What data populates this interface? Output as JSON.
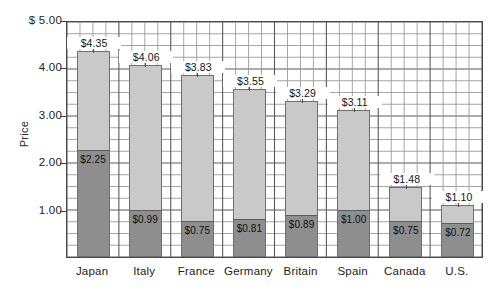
{
  "chart_data": {
    "type": "bar",
    "subtype": "stacked-bar",
    "title": "",
    "xlabel": "",
    "ylabel": "Price",
    "ylim": [
      0,
      5
    ],
    "y_ticks": [
      {
        "value": 5,
        "label": "$ 5.00"
      },
      {
        "value": 4,
        "label": "4.00"
      },
      {
        "value": 3,
        "label": "3.00"
      },
      {
        "value": 2,
        "label": "2.00"
      },
      {
        "value": 1,
        "label": "1.00"
      }
    ],
    "y_minor_step": 0.25,
    "grid": true,
    "legend": "none",
    "categories": [
      "Japan",
      "Italy",
      "France",
      "Germany",
      "Britain",
      "Spain",
      "Canada",
      "U.S."
    ],
    "series": [
      {
        "name": "Base price",
        "color": "#8e8e8e",
        "values": [
          2.25,
          0.99,
          0.75,
          0.81,
          0.89,
          1.0,
          0.75,
          0.72
        ],
        "labels": [
          "$2.25",
          "$0.99",
          "$0.75",
          "$0.81",
          "$0.89",
          "$1.00",
          "$0.75",
          "$0.72"
        ]
      },
      {
        "name": "Remainder",
        "color": "#c9c9c9",
        "values": [
          2.1,
          3.07,
          3.08,
          2.74,
          2.4,
          2.11,
          0.73,
          0.38
        ]
      }
    ],
    "totals": [
      4.35,
      4.06,
      3.83,
      3.55,
      3.29,
      3.11,
      1.48,
      1.1
    ],
    "total_labels": [
      "$4.35",
      "$4.06",
      "$3.83",
      "$3.55",
      "$3.29",
      "$3.11",
      "$1.48",
      "$1.10"
    ]
  },
  "colors": {
    "bar_light": "#c9c9c9",
    "bar_dark": "#8e8e8e",
    "grid": "#9a9a9a",
    "grid_major": "#5a5a5a",
    "frame": "#4a4a4a",
    "text": "#1a1a1a",
    "background": "#ffffff"
  }
}
